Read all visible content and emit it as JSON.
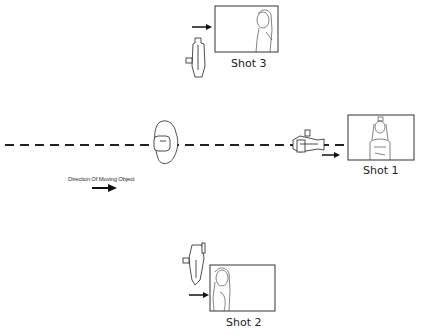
{
  "diagram": {
    "shots": [
      {
        "id": "shot3",
        "label": "Shot 3"
      },
      {
        "id": "shot1",
        "label": "Shot 1"
      },
      {
        "id": "shot2",
        "label": "Shot 2"
      }
    ],
    "direction_label": "Direction Of Moving Object",
    "colors": {
      "line": "#222222",
      "background": "#ffffff"
    }
  }
}
